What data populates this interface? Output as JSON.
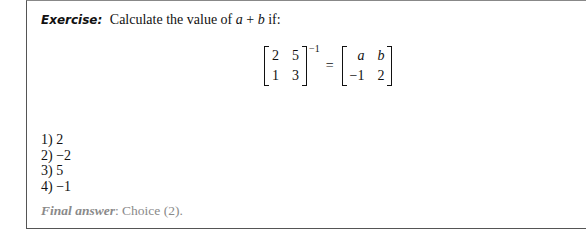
{
  "exercise": {
    "label": "Exercise:",
    "text_before": "Calculate the value of ",
    "var_a": "a",
    "plus": " + ",
    "var_b": "b",
    "text_after": " if:"
  },
  "equation": {
    "left_matrix": [
      [
        "2",
        "5"
      ],
      [
        "1",
        "3"
      ]
    ],
    "exponent": "−1",
    "equals": "=",
    "right_matrix": [
      [
        "a",
        "b"
      ],
      [
        "−1",
        "2"
      ]
    ]
  },
  "options": [
    {
      "label": "1)",
      "value": "2"
    },
    {
      "label": "2)",
      "value": "−2"
    },
    {
      "label": "3)",
      "value": "5"
    },
    {
      "label": "4)",
      "value": "−1"
    }
  ],
  "final_answer": {
    "label": "Final answer",
    "text": ": Choice (2)."
  }
}
